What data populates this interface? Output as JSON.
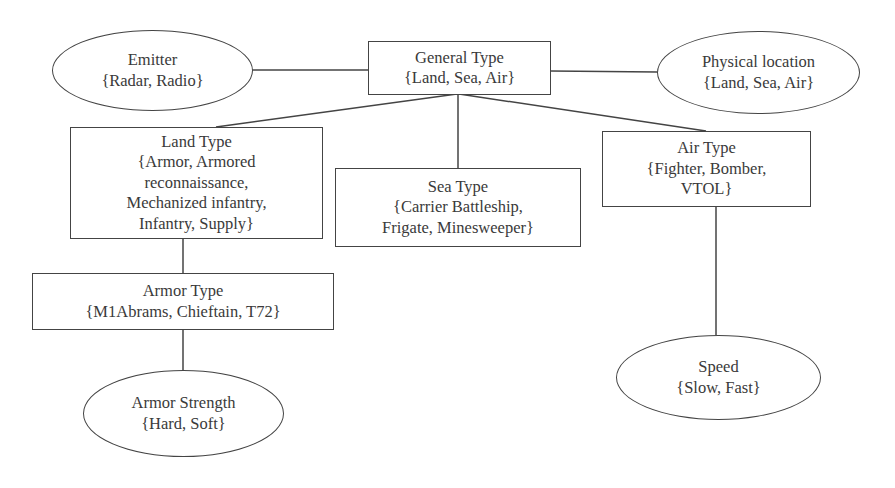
{
  "diagram": {
    "type": "hierarchy",
    "nodes": {
      "general_type": {
        "shape": "rectangle",
        "title": "General Type",
        "values": [
          "{Land, Sea, Air}"
        ]
      },
      "emitter": {
        "shape": "ellipse",
        "title": "Emitter",
        "values": [
          "{Radar, Radio}"
        ]
      },
      "physical_location": {
        "shape": "ellipse",
        "title": "Physical location",
        "values": [
          "{Land, Sea, Air}"
        ]
      },
      "land_type": {
        "shape": "rectangle",
        "title": "Land Type",
        "values": [
          "{Armor, Armored",
          "reconnaissance,",
          "Mechanized infantry,",
          "Infantry, Supply}"
        ]
      },
      "sea_type": {
        "shape": "rectangle",
        "title": "Sea Type",
        "values": [
          "{Carrier Battleship,",
          "Frigate, Minesweeper}"
        ]
      },
      "air_type": {
        "shape": "rectangle",
        "title": "Air Type",
        "values": [
          "{Fighter, Bomber,",
          "VTOL}"
        ]
      },
      "armor_type": {
        "shape": "rectangle",
        "title": "Armor Type",
        "values": [
          "{M1Abrams, Chieftain, T72}"
        ]
      },
      "speed": {
        "shape": "ellipse",
        "title": "Speed",
        "values": [
          "{Slow, Fast}"
        ]
      },
      "armor_strength": {
        "shape": "ellipse",
        "title": "Armor Strength",
        "values": [
          "{Hard, Soft}"
        ]
      }
    },
    "edges": [
      {
        "from": "general_type",
        "to": "emitter"
      },
      {
        "from": "general_type",
        "to": "physical_location"
      },
      {
        "from": "general_type",
        "to": "land_type"
      },
      {
        "from": "general_type",
        "to": "sea_type"
      },
      {
        "from": "general_type",
        "to": "air_type"
      },
      {
        "from": "land_type",
        "to": "armor_type"
      },
      {
        "from": "armor_type",
        "to": "armor_strength"
      },
      {
        "from": "air_type",
        "to": "speed"
      }
    ],
    "colors": {
      "stroke": "#444444",
      "text": "#3a3a3a",
      "background": "#ffffff"
    }
  }
}
